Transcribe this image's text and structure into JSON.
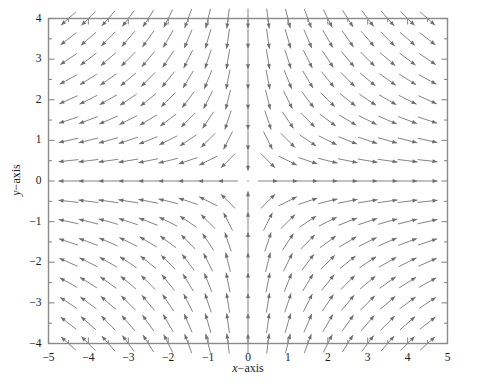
{
  "chart_data": {
    "type": "scatter",
    "plot_kind": "quiver-vector-field",
    "title": "",
    "subtitle": "",
    "xlabel": "x−axis",
    "ylabel": "y−axis",
    "xlim": [
      -5,
      5
    ],
    "ylim": [
      -4,
      4
    ],
    "grid": false,
    "legend": null,
    "xticks": [
      -5,
      -4,
      -3,
      -2,
      -1,
      0,
      1,
      2,
      3,
      4,
      5
    ],
    "xtick_labels": [
      "−5",
      "−4",
      "−3",
      "−2",
      "−1",
      "0",
      "1",
      "2",
      "3",
      "4",
      "5"
    ],
    "yticks": [
      -4,
      -3,
      -2,
      -1,
      0,
      1,
      2,
      3,
      4
    ],
    "ytick_labels": [
      "−4",
      "−3",
      "−2",
      "−1",
      "0",
      "1",
      "2",
      "3",
      "4"
    ],
    "minor_tick_step": 0.5,
    "arrow_color": "#6e6e6e",
    "frame_color": "#8a8a8a",
    "field": {
      "u_expression": "x",
      "v_expression": "-y",
      "normalized": true,
      "grid_x_min": -4.5,
      "grid_x_max": 4.5,
      "grid_y_min": -4.0,
      "grid_y_max": 4.0,
      "grid_step": 0.5,
      "arrow_pixel_length": 20
    },
    "annotations": []
  },
  "axes": {
    "x_title_var": "x",
    "x_title_rest": "−axis",
    "y_title_var": "y",
    "y_title_rest": "−axis"
  }
}
